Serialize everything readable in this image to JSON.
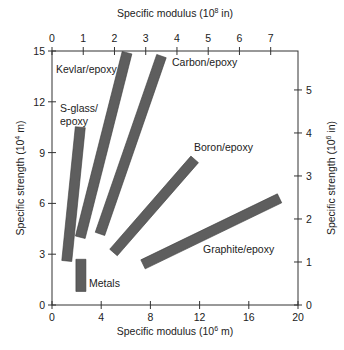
{
  "chart_data": {
    "type": "bar",
    "subtype": "range-band",
    "title": "",
    "xlabel": "Specific modulus (10^6 m)",
    "xlabel_top": "Specific modulus (10^8 in)",
    "ylabel": "Specific strength (10^4 m)",
    "ylabel_right": "Specific strength (10^6 in)",
    "xlim": [
      0,
      20
    ],
    "ylim": [
      0,
      15
    ],
    "xlim_top": [
      0,
      8.1
    ],
    "ylim_right": [
      0,
      5.9
    ],
    "x_ticks": [
      "0",
      "4",
      "8",
      "12",
      "16",
      "20"
    ],
    "y_ticks": [
      "0",
      "3",
      "6",
      "9",
      "12",
      "15"
    ],
    "x_ticks_top": [
      "0",
      "1",
      "2",
      "3",
      "4",
      "5",
      "6",
      "7"
    ],
    "y_ticks_right": [
      "0",
      "1",
      "2",
      "3",
      "4",
      "5"
    ],
    "grid": false,
    "legend": "none (direct labels)",
    "series": [
      {
        "name": "Kevlar/epoxy",
        "start": [
          2.3,
          4.0
        ],
        "end": [
          6.1,
          14.9
        ]
      },
      {
        "name": "Carbon/epoxy",
        "start": [
          3.9,
          4.2
        ],
        "end": [
          8.9,
          14.7
        ]
      },
      {
        "name": "S-glass/epoxy",
        "start": [
          1.2,
          2.6
        ],
        "end": [
          2.3,
          10.5
        ]
      },
      {
        "name": "Boron/epoxy",
        "start": [
          5.0,
          3.1
        ],
        "end": [
          11.6,
          8.6
        ]
      },
      {
        "name": "Graphite/epoxy",
        "start": [
          7.4,
          2.4
        ],
        "end": [
          18.5,
          6.3
        ]
      },
      {
        "name": "Metals",
        "start": [
          2.35,
          0.8
        ],
        "end": [
          2.35,
          2.7
        ]
      }
    ]
  },
  "labels": {
    "xlabel_bottom_main": "Specific modulus (10",
    "xlabel_bottom_exp": "6",
    "xlabel_bottom_unit": " m)",
    "xlabel_top_main": "Specific modulus (10",
    "xlabel_top_exp": "8",
    "xlabel_top_unit": " in)",
    "ylabel_left_main": "Specific strength (10",
    "ylabel_left_exp": "4",
    "ylabel_left_unit": " m)",
    "ylabel_right_main": "Specific strength (10",
    "ylabel_right_exp": "6",
    "ylabel_right_unit": " in)",
    "kevlar": "Kevlar/epoxy",
    "carbon": "Carbon/epoxy",
    "sglass_1": "S-glass/",
    "sglass_2": "epoxy",
    "boron": "Boron/epoxy",
    "graphite": "Graphite/epoxy",
    "metals": "Metals"
  },
  "colors": {
    "bar_fill": "#5e5e5e",
    "bar_stroke": "#3a3a3a",
    "axis": "#333333"
  }
}
